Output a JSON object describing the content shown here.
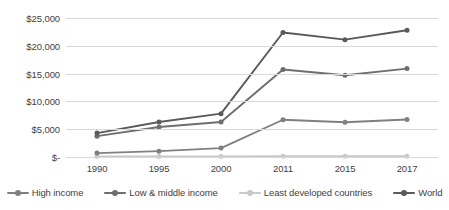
{
  "chart_data": {
    "type": "line",
    "title": "",
    "subtitle": "",
    "xlabel": "",
    "ylabel": "",
    "categories": [
      "1990",
      "1995",
      "2000",
      "2011",
      "2015",
      "2017"
    ],
    "ylim": [
      0,
      25000
    ],
    "ytick_values": [
      0,
      5000,
      10000,
      15000,
      20000,
      25000
    ],
    "ytick_labels": [
      "$-",
      "$5,000",
      "$10,000",
      "$15,000",
      "$20,000",
      "$25,000"
    ],
    "grid": "horizontal",
    "legend_position": "bottom",
    "series": [
      {
        "name": "High income",
        "color": "#808080",
        "marker": "circle",
        "values": [
          700,
          1050,
          1600,
          6700,
          6250,
          6750
        ]
      },
      {
        "name": "Low & middle income",
        "color": "#6e6e6e",
        "marker": "circle",
        "values": [
          3750,
          5400,
          6300,
          15750,
          14700,
          15900
        ]
      },
      {
        "name": "Least developed countries",
        "color": "#c9c9c9",
        "marker": "circle",
        "values": [
          80,
          90,
          100,
          140,
          130,
          150
        ]
      },
      {
        "name": "World",
        "color": "#5a5a5a",
        "marker": "circle",
        "values": [
          4300,
          6300,
          7800,
          22400,
          21100,
          22800
        ]
      }
    ]
  },
  "legend": {
    "items": [
      {
        "label": "High income"
      },
      {
        "label": "Low & middle income"
      },
      {
        "label": "Least developed countries"
      },
      {
        "label": "World"
      }
    ]
  }
}
